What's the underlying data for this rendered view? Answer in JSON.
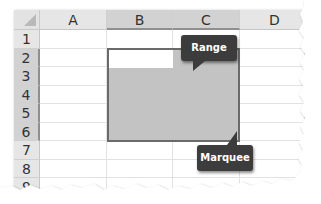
{
  "spreadsheet": {
    "columns": [
      "A",
      "B",
      "C",
      "D"
    ],
    "rows": [
      "1",
      "2",
      "3",
      "4",
      "5",
      "6",
      "7",
      "8",
      "9"
    ],
    "selected_columns": [
      "B",
      "C"
    ],
    "selected_rows": [
      "2",
      "3",
      "4",
      "5",
      "6"
    ],
    "selection_range": "B2:C6",
    "active_cell": "B2"
  },
  "callouts": {
    "range": "Range",
    "marquee": "Marquee"
  },
  "colors": {
    "selection_fill": "#c3c3c3",
    "selection_border": "#6a6a6a",
    "header_bg": "#e6e6e6",
    "selected_header_bg": "#d2d2d2",
    "callout_bg": "#3c3c3c",
    "callout_text": "#ffffff"
  }
}
